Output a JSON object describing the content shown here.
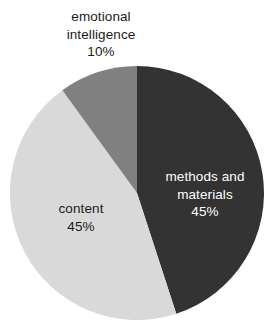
{
  "chart_data": {
    "type": "pie",
    "title": "",
    "subtitle": "",
    "xlabel": "",
    "ylabel": "",
    "grid": false,
    "legend": "none",
    "background": "#ffffff",
    "total": 100,
    "units": "%",
    "start_angle_deg": 0,
    "direction": "clockwise",
    "geometry": {
      "center_x": 137,
      "center_y": 193,
      "radius": 127
    },
    "categories": [
      "methods and materials",
      "content",
      "emotional intelligence"
    ],
    "values": [
      45,
      45,
      10
    ],
    "colors": [
      "#333333",
      "#d9d9d9",
      "#808080"
    ],
    "slices": [
      {
        "name": "methods and materials",
        "value": 45,
        "value_label": "45%",
        "color": "#333333",
        "label_color": "#ffffff",
        "label_position": "inside",
        "start_angle_deg": 0,
        "end_angle_deg": 162
      },
      {
        "name": "content",
        "value": 45,
        "value_label": "45%",
        "color": "#d9d9d9",
        "label_color": "#1b1b1b",
        "label_position": "inside",
        "start_angle_deg": 162,
        "end_angle_deg": 324
      },
      {
        "name": "emotional intelligence",
        "value": 10,
        "value_label": "10%",
        "color": "#808080",
        "label_color": "#1b1b1b",
        "label_position": "outside-top",
        "start_angle_deg": 324,
        "end_angle_deg": 360
      }
    ]
  },
  "labels": {
    "emotional_intelligence": {
      "line1": "emotional",
      "line2": "intelligence",
      "value": "10%"
    },
    "methods_and_materials": {
      "line1": "methods and",
      "line2": "materials",
      "value": "45%"
    },
    "content": {
      "line1": "content",
      "value": "45%"
    }
  }
}
